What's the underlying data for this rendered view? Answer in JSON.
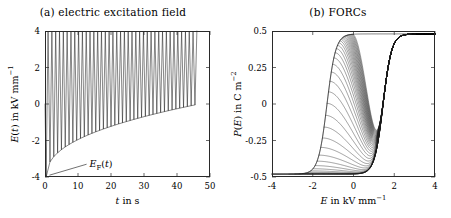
{
  "figure": {
    "panels": [
      {
        "id": "a",
        "title": "(a) electric excitation field",
        "x_title_html": "t in s",
        "y_title_html": "E(t) in kV mm-1",
        "xlim": [
          0,
          50
        ],
        "ylim": [
          -4,
          4
        ],
        "xticks": [
          0,
          10,
          20,
          30,
          40,
          50
        ],
        "xticklabels": [
          "0",
          "10",
          "20",
          "30",
          "40",
          "50"
        ],
        "yticks": [
          -4,
          -2,
          0,
          2,
          4
        ],
        "yticklabels": [
          "-4",
          "-2",
          "0",
          "2",
          "4"
        ],
        "annotation": {
          "text_html": "EF(t)",
          "x": 13.5,
          "y": -3.35,
          "leader_from": [
            12.6,
            -3.3
          ],
          "leader_to": [
            1.35,
            -3.9
          ]
        }
      },
      {
        "id": "b",
        "title": "(b) FORCs",
        "x_title_html": "E in kV mm-1",
        "y_title_html": "P(E) in C m-2",
        "xlim": [
          -4,
          4
        ],
        "ylim": [
          -0.5,
          0.5
        ],
        "xticks": [
          -4,
          -2,
          0,
          2,
          4
        ],
        "xticklabels": [
          "-4",
          "-2",
          "0",
          "2",
          "4"
        ],
        "yticks": [
          -0.5,
          -0.25,
          0,
          0.25,
          0.5
        ],
        "yticklabels": [
          "-0.5",
          "-0.25",
          "0",
          "0.25",
          "0.5"
        ]
      }
    ]
  },
  "chart_data": [
    {
      "type": "line",
      "panel": "a",
      "title": "(a) electric excitation field",
      "xlabel": "t in s",
      "ylabel": "E(t) in kV mm^-1",
      "xlim": [
        0,
        50
      ],
      "ylim": [
        -4,
        4
      ],
      "xticks": [
        0,
        10,
        20,
        30,
        40,
        50
      ],
      "yticks": [
        -4,
        -2,
        0,
        2,
        4
      ],
      "grid": false,
      "legend": null,
      "description": "Triangular FORC excitation waveform: every sweep rises to the positive saturation field +4 kV/mm, while successive reversal (minimum) fields E_F rise monotonically from -4 kV/mm toward about 0 kV/mm.",
      "series": [
        {
          "name": "E(t)",
          "color": "#1a1a1a",
          "waveform": "forc-triangular",
          "n_cycles": 40,
          "t_start": 0.35,
          "t_end": 46.6,
          "e_max": 4.0,
          "reversal_start": -4.0,
          "reversal_end": -0.05,
          "reversal_curvature": 2.35
        },
        {
          "name": "E_F(t) envelope",
          "color": "#1a1a1a",
          "description": "Lower envelope connecting the reversal field minima."
        }
      ],
      "annotations": [
        {
          "text": "E_F(t)",
          "x": 13.5,
          "y": -3.35
        }
      ]
    },
    {
      "type": "line",
      "panel": "b",
      "title": "(b) FORCs",
      "xlabel": "E in kV mm^-1",
      "ylabel": "P(E) in C m^-2",
      "xlim": [
        -4,
        4
      ],
      "ylim": [
        -0.5,
        0.5
      ],
      "xticks": [
        -4,
        -2,
        0,
        2,
        4
      ],
      "yticks": [
        -0.5,
        -0.25,
        0,
        0.25,
        0.5
      ],
      "grid": false,
      "legend": null,
      "description": "Family of first-order reversal curves of a ferroelectric hysteresis loop. Each curve starts on the descending (major) branch at its reversal field E_F and is then traced upward to positive saturation, producing a nested fan of minor loops. Saturation polarisation is about +-0.48 C/m^2; the switching (coercive) field on the ascending branch is near +1.45 kV/mm, and the descending branch switches near -1.3 kV/mm.",
      "n_curves": 40,
      "p_saturation": 0.48,
      "coercive_ascending": 1.45,
      "coercive_descending": -1.3,
      "reversal_fields_first": -4.0,
      "reversal_fields_last": -0.05,
      "series": [
        {
          "name": "major descending branch",
          "color": "#1a1a1a"
        },
        {
          "name": "first-order reversal curves",
          "color": "#1a1a1a"
        }
      ]
    }
  ]
}
